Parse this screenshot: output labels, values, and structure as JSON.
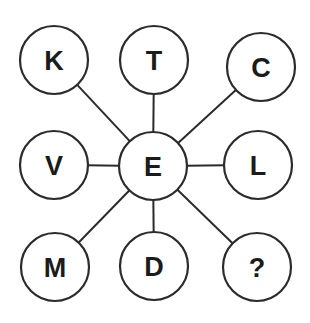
{
  "diagram": {
    "type": "hub-and-spoke",
    "canvas": {
      "width": 310,
      "height": 323,
      "background": "#ffffff"
    },
    "style": {
      "stroke_color": "#2b2b2b",
      "text_color": "#1b1b1b",
      "node_fill": "#ffffff",
      "node_stroke_width": 2.2,
      "spoke_stroke_width": 2,
      "node_radius": 34,
      "label_font_size": 27
    },
    "hub": {
      "id": "hub-e",
      "label": "E",
      "cx": 153,
      "cy": 166,
      "r": 34
    },
    "nodes": [
      {
        "id": "node-k",
        "label": "K",
        "cx": 54,
        "cy": 60,
        "r": 34,
        "position": "top-left"
      },
      {
        "id": "node-t",
        "label": "T",
        "cx": 154,
        "cy": 60,
        "r": 34,
        "position": "top-center"
      },
      {
        "id": "node-c",
        "label": "C",
        "cx": 261,
        "cy": 67,
        "r": 34,
        "position": "top-right"
      },
      {
        "id": "node-v",
        "label": "V",
        "cx": 54,
        "cy": 165,
        "r": 34,
        "position": "middle-left"
      },
      {
        "id": "node-l",
        "label": "L",
        "cx": 258,
        "cy": 165,
        "r": 34,
        "position": "middle-right"
      },
      {
        "id": "node-m",
        "label": "M",
        "cx": 55,
        "cy": 267,
        "r": 34,
        "position": "bottom-left"
      },
      {
        "id": "node-d",
        "label": "D",
        "cx": 154,
        "cy": 266,
        "r": 34,
        "position": "bottom-center"
      },
      {
        "id": "node-q",
        "label": "?",
        "cx": 257,
        "cy": 267,
        "r": 34,
        "position": "bottom-right"
      }
    ],
    "edges": [
      {
        "id": "edge-e-k",
        "from": "hub-e",
        "to": "node-k"
      },
      {
        "id": "edge-e-t",
        "from": "hub-e",
        "to": "node-t"
      },
      {
        "id": "edge-e-c",
        "from": "hub-e",
        "to": "node-c"
      },
      {
        "id": "edge-e-v",
        "from": "hub-e",
        "to": "node-v"
      },
      {
        "id": "edge-e-l",
        "from": "hub-e",
        "to": "node-l"
      },
      {
        "id": "edge-e-m",
        "from": "hub-e",
        "to": "node-m"
      },
      {
        "id": "edge-e-d",
        "from": "hub-e",
        "to": "node-d"
      },
      {
        "id": "edge-e-q",
        "from": "hub-e",
        "to": "node-q"
      }
    ]
  }
}
